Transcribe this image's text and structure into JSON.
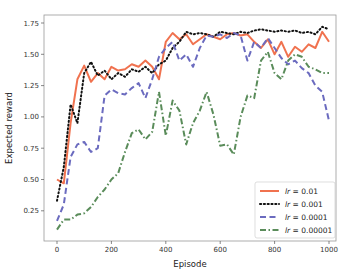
{
  "chart_data": {
    "type": "line",
    "title": "",
    "xlabel": "Episode",
    "ylabel": "Expected reward",
    "xlim": [
      -40,
      1025
    ],
    "ylim": [
      0.0,
      1.8
    ],
    "xticks": [
      0,
      200,
      400,
      600,
      800,
      1000
    ],
    "xtick_labels": [
      "0",
      "200",
      "400",
      "600",
      "800",
      "1000"
    ],
    "yticks": [
      0.25,
      0.5,
      0.75,
      1.0,
      1.25,
      1.5,
      1.75
    ],
    "ytick_labels": [
      "0.25",
      "0.50",
      "0.75",
      "1.00",
      "1.25",
      "1.50",
      "1.75"
    ],
    "grid": false,
    "legend_position": "bottom-right",
    "x": [
      0,
      25,
      50,
      75,
      100,
      125,
      150,
      175,
      200,
      225,
      250,
      275,
      300,
      325,
      350,
      375,
      400,
      425,
      450,
      475,
      500,
      525,
      550,
      575,
      600,
      625,
      650,
      675,
      700,
      725,
      750,
      775,
      800,
      825,
      850,
      875,
      900,
      925,
      950,
      975,
      1000
    ],
    "series": [
      {
        "name": "lr = 0.01",
        "legend_prefix": "lr",
        "legend_value": "= 0.01",
        "color": "#f0724f",
        "style": "solid",
        "values": [
          0.5,
          0.47,
          0.95,
          1.3,
          1.41,
          1.28,
          1.35,
          1.3,
          1.4,
          1.37,
          1.38,
          1.42,
          1.4,
          1.45,
          1.4,
          1.3,
          1.6,
          1.67,
          1.62,
          1.66,
          1.58,
          1.62,
          1.66,
          1.64,
          1.62,
          1.66,
          1.67,
          1.65,
          1.66,
          1.6,
          1.55,
          1.62,
          1.5,
          1.6,
          1.48,
          1.56,
          1.52,
          1.58,
          1.55,
          1.68,
          1.6
        ]
      },
      {
        "name": "lr = 0.001",
        "legend_prefix": "lr",
        "legend_value": "= 0.001",
        "color": "#111111",
        "style": "dotted",
        "values": [
          0.33,
          0.6,
          1.1,
          0.95,
          1.35,
          1.44,
          1.33,
          1.37,
          1.3,
          1.35,
          1.32,
          1.38,
          1.36,
          1.4,
          1.35,
          1.42,
          1.45,
          1.55,
          1.6,
          1.68,
          1.66,
          1.67,
          1.66,
          1.64,
          1.68,
          1.67,
          1.66,
          1.68,
          1.67,
          1.69,
          1.7,
          1.69,
          1.68,
          1.69,
          1.68,
          1.69,
          1.67,
          1.68,
          1.66,
          1.72,
          1.7
        ]
      },
      {
        "name": "lr = 0.0001",
        "legend_prefix": "lr",
        "legend_value": "= 0.0001",
        "color": "#6b6bbf",
        "style": "dashed",
        "values": [
          0.17,
          0.3,
          0.68,
          0.78,
          0.8,
          0.72,
          0.75,
          1.17,
          1.22,
          1.19,
          1.18,
          1.23,
          1.27,
          1.15,
          1.3,
          1.48,
          1.55,
          1.6,
          1.45,
          1.5,
          1.4,
          1.55,
          1.65,
          1.64,
          1.66,
          1.63,
          1.67,
          1.65,
          1.45,
          1.6,
          1.55,
          1.63,
          1.55,
          1.47,
          1.42,
          1.45,
          1.39,
          1.35,
          1.25,
          1.2,
          0.97
        ]
      },
      {
        "name": "lr = 0.00001",
        "legend_prefix": "lr",
        "legend_value": "= 0.00001",
        "color": "#5a8c5a",
        "style": "dashdot",
        "values": [
          0.1,
          0.18,
          0.18,
          0.22,
          0.23,
          0.28,
          0.36,
          0.42,
          0.5,
          0.55,
          0.72,
          0.87,
          0.9,
          0.82,
          0.88,
          1.2,
          0.85,
          1.13,
          1.05,
          0.78,
          0.95,
          1.05,
          1.2,
          1.02,
          0.77,
          0.78,
          0.7,
          1.0,
          1.17,
          1.15,
          1.45,
          1.52,
          1.35,
          1.3,
          1.45,
          1.5,
          1.48,
          1.4,
          1.38,
          1.35,
          1.35
        ]
      }
    ]
  }
}
